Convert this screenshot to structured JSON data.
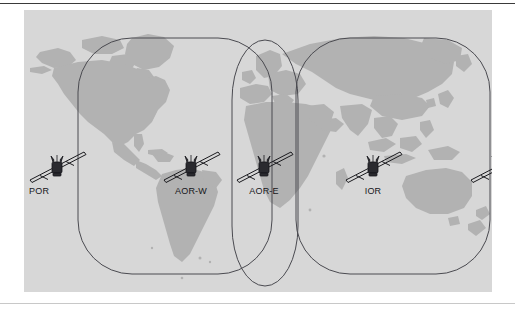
{
  "figure": {
    "background_color": "#ffffff",
    "map_background_color": "#d7d7d7",
    "land_color": "#b2b2b2",
    "outline_color": "#4a4a50",
    "text_color": "#16161a"
  },
  "rules": {
    "top_color": "#3a3a3a",
    "bottom_color": "#c8c8c8"
  },
  "satellites": [
    {
      "id": "por-west",
      "label": "POR",
      "icon": "satellite-icon",
      "region": "Pacific Ocean Region",
      "x": 2,
      "y": 136
    },
    {
      "id": "aor-west",
      "label": "AOR-W",
      "icon": "satellite-icon",
      "region": "Atlantic Ocean Region West",
      "x": 136,
      "y": 136
    },
    {
      "id": "aor-east",
      "label": "AOR-E",
      "icon": "satellite-icon",
      "region": "Atlantic Ocean Region East",
      "x": 209,
      "y": 136
    },
    {
      "id": "ior",
      "label": "IOR",
      "icon": "satellite-icon",
      "region": "Indian Ocean Region",
      "x": 318,
      "y": 136
    },
    {
      "id": "por-east",
      "label": "POR",
      "icon": "satellite-icon",
      "region": "Pacific Ocean Region",
      "x": 443,
      "y": 136
    }
  ],
  "coverage_regions": [
    {
      "id": "aor-west-coverage",
      "name": "AOR-W coverage outline",
      "shape": "rounded-rectangle"
    },
    {
      "id": "aor-east-coverage",
      "name": "AOR-E coverage outline",
      "shape": "stadium"
    },
    {
      "id": "ior-coverage",
      "name": "IOR coverage outline",
      "shape": "rounded-rectangle"
    }
  ]
}
